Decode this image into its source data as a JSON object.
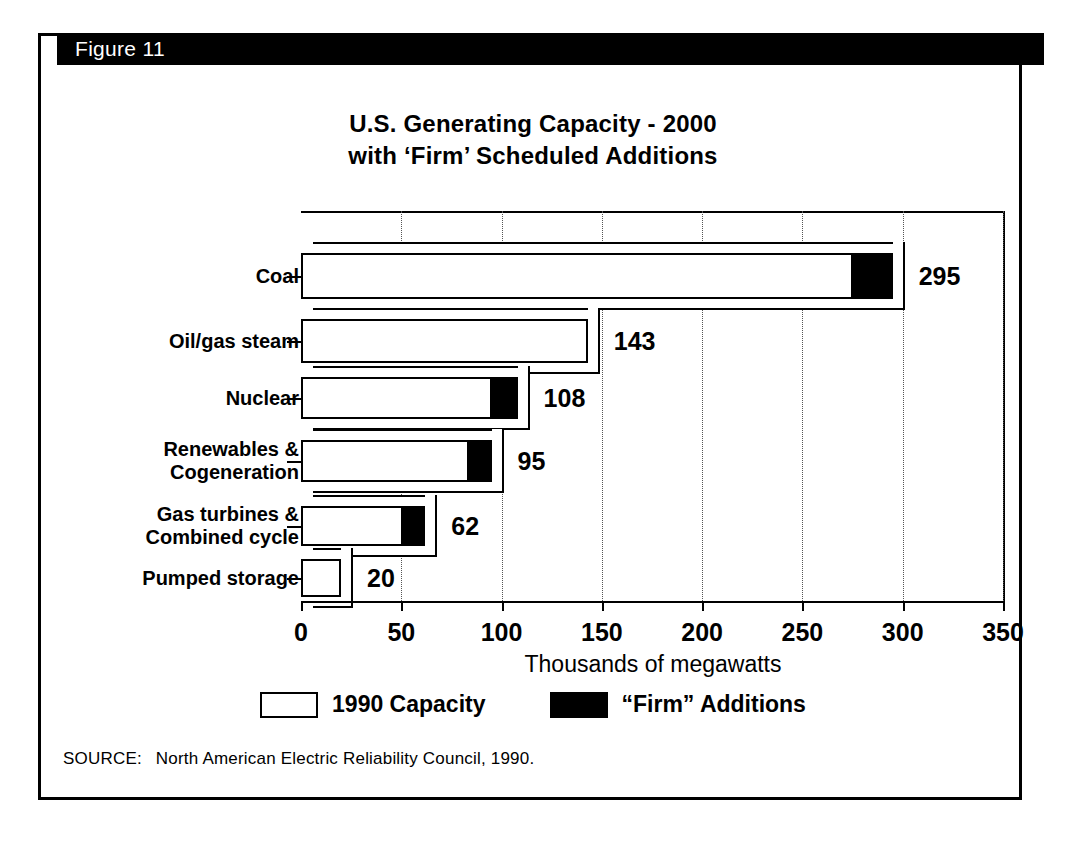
{
  "figure": {
    "header_label": "Figure 11",
    "title_line1": "U.S. Generating Capacity - 2000",
    "title_line2": "with ‘Firm’ Scheduled Additions",
    "source_label": "SOURCE:",
    "source_text": "North American Electric Reliability Council, 1990."
  },
  "legend": {
    "items": [
      {
        "label": "1990 Capacity",
        "swatch": "dotted"
      },
      {
        "label": "“Firm” Additions",
        "swatch": "solid"
      }
    ]
  },
  "colors": {
    "ink": "#000000",
    "paper": "#ffffff",
    "capacity_fill": "#ffffff",
    "additions_fill": "#000000"
  },
  "chart_data": {
    "type": "bar",
    "orientation": "horizontal",
    "stacked": true,
    "title": "U.S. Generating Capacity - 2000 with ‘Firm’ Scheduled Additions",
    "xlabel": "Thousands of megawatts",
    "ylabel": "",
    "xlim": [
      0,
      350
    ],
    "xticks": [
      0,
      50,
      100,
      150,
      200,
      250,
      300,
      350
    ],
    "xtick_labels": [
      "0",
      "50",
      "100",
      "150",
      "200",
      "250",
      "300",
      "350"
    ],
    "grid": "vertical-dotted",
    "legend_position": "bottom-center",
    "categories": [
      "Coal",
      "Oil/gas steam",
      "Nuclear",
      "Renewables & Cogeneration",
      "Gas turbines & Combined cycle",
      "Pumped storage"
    ],
    "category_label_lines": [
      [
        "Coal"
      ],
      [
        "Oil/gas steam"
      ],
      [
        "Nuclear"
      ],
      [
        "Renewables &",
        "Cogeneration"
      ],
      [
        "Gas turbines &",
        "Combined cycle"
      ],
      [
        "Pumped storage"
      ]
    ],
    "series": [
      {
        "name": "1990 Capacity",
        "values": [
          275,
          143,
          95,
          84,
          51,
          20
        ]
      },
      {
        "name": "“Firm” Additions",
        "values": [
          20,
          0,
          13,
          11,
          11,
          0
        ]
      }
    ],
    "totals": [
      295,
      143,
      108,
      95,
      62,
      20
    ],
    "data_labels": [
      "295",
      "143",
      "108",
      "95",
      "62",
      "20"
    ],
    "units": "thousands of megawatts",
    "source": "North American Electric Reliability Council, 1990."
  }
}
